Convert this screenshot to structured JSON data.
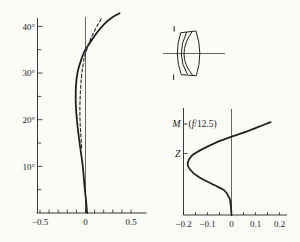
{
  "figure": {
    "background": "#fbfbf8",
    "ink": "#222222"
  },
  "chart_data": [
    {
      "id": "field-curvature",
      "type": "line",
      "title": "",
      "xlabel": "",
      "ylabel": "field angle (deg)",
      "xlim": [
        -0.55,
        0.67
      ],
      "ylim": [
        0,
        43
      ],
      "grid": false,
      "zero_line_x": 0,
      "x_ticks": [
        -0.5,
        -0.4,
        -0.3,
        -0.2,
        -0.1,
        0,
        0.1,
        0.2,
        0.3,
        0.4,
        0.5
      ],
      "x_tick_labels": [
        {
          "value": -0.5,
          "label": "−0.5"
        },
        {
          "value": 0,
          "label": "0"
        },
        {
          "value": 0.5,
          "label": "0.5"
        }
      ],
      "y_major_ticks": [
        {
          "value": 10,
          "label": "10°"
        },
        {
          "value": 20,
          "label": "20°"
        },
        {
          "value": 30,
          "label": "30°"
        },
        {
          "value": 40,
          "label": "40°"
        }
      ],
      "y_minor_ticks": [
        5,
        15,
        25,
        35
      ],
      "series": [
        {
          "name": "solid-field-curve",
          "style": "solid",
          "points": [
            [
              0.018,
              0
            ],
            [
              0.004,
              3
            ],
            [
              -0.012,
              6
            ],
            [
              -0.03,
              10
            ],
            [
              -0.065,
              15
            ],
            [
              -0.095,
              20
            ],
            [
              -0.108,
              24
            ],
            [
              -0.102,
              28
            ],
            [
              -0.083,
              30.5
            ],
            [
              -0.053,
              32.5
            ],
            [
              -0.015,
              34.5
            ],
            [
              0.05,
              36.5
            ],
            [
              0.12,
              38.5
            ],
            [
              0.205,
              40.5
            ],
            [
              0.3,
              42
            ],
            [
              0.375,
              42.8
            ]
          ]
        },
        {
          "name": "dashed-field-curve",
          "style": "dashed",
          "points": [
            [
              -0.042,
              14
            ],
            [
              -0.053,
              17
            ],
            [
              -0.06,
              20
            ],
            [
              -0.061,
              23
            ],
            [
              -0.056,
              26
            ],
            [
              -0.045,
              29
            ],
            [
              -0.029,
              31.5
            ],
            [
              -0.011,
              33.5
            ],
            [
              0.013,
              35
            ],
            [
              0.045,
              36.8
            ],
            [
              0.08,
              38.3
            ],
            [
              0.125,
              40
            ],
            [
              0.178,
              41.8
            ]
          ]
        }
      ]
    },
    {
      "id": "longitudinal-spherical-aberration",
      "type": "line",
      "title": "",
      "aperture_label": {
        "prefix": "(",
        "symbol": "f",
        "suffix": "/12.5)"
      },
      "xlim": [
        -0.2,
        0.23
      ],
      "ylim": [
        0,
        1.02
      ],
      "grid": false,
      "zero_line_x": 0,
      "x_ticks": [
        -0.2,
        -0.15,
        -0.1,
        -0.05,
        0,
        0.05,
        0.1,
        0.15,
        0.2
      ],
      "x_tick_labels": [
        {
          "value": -0.2,
          "label": "−0.2"
        },
        {
          "value": -0.1,
          "label": "−0.1"
        },
        {
          "value": 0,
          "label": "0"
        },
        {
          "value": 0.1,
          "label": "0.1"
        },
        {
          "value": 0.2,
          "label": "0.2"
        }
      ],
      "y_marks": [
        {
          "label": "M",
          "zone": 1.0
        },
        {
          "label": "Z",
          "zone": 0.676
        }
      ],
      "series": [
        {
          "name": "spherical-aberration-curve",
          "style": "solid",
          "points": [
            [
              0,
              0
            ],
            [
              -0.003,
              0.1
            ],
            [
              -0.008,
              0.18
            ],
            [
              -0.03,
              0.27
            ],
            [
              -0.072,
              0.33
            ],
            [
              -0.138,
              0.42
            ],
            [
              -0.173,
              0.5
            ],
            [
              -0.183,
              0.57
            ],
            [
              -0.166,
              0.65
            ],
            [
              -0.131,
              0.71
            ],
            [
              -0.069,
              0.79
            ],
            [
              0,
              0.86
            ],
            [
              0.065,
              0.92
            ],
            [
              0.115,
              0.97
            ],
            [
              0.163,
              1.02
            ]
          ]
        }
      ]
    }
  ]
}
